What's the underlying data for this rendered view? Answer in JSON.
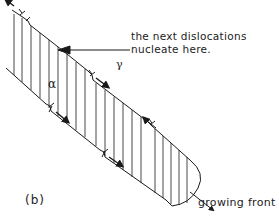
{
  "figure": {
    "panel_label": "(b)",
    "annotation": {
      "line1": "the next dislocations",
      "line2": "nucleate here."
    },
    "phase_labels": {
      "alpha": "α",
      "gamma": "γ"
    },
    "growing_front_label": "growing front",
    "colors": {
      "ink": "#1a1a1a",
      "background": "#ffffff"
    }
  }
}
